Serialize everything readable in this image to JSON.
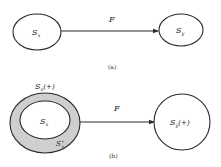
{
  "panel_a": {
    "source_node": {
      "label": "S",
      "subscript": "x"
    },
    "target_node": {
      "label": "S",
      "subscript": "y"
    },
    "edge_label": "F",
    "caption": "(a)"
  },
  "panel_b": {
    "outer_region": {
      "label": "S",
      "subscript": "x",
      "suffix": "(+)"
    },
    "inner_node": {
      "label": "S",
      "subscript": "x"
    },
    "ring_region": {
      "label": "S",
      "subscript": "x",
      "superscript": "+"
    },
    "target_node": {
      "label": "S",
      "subscript": "y",
      "suffix": "(+)"
    },
    "edge_label": "F",
    "caption": "(b)"
  },
  "colors": {
    "stroke": "#2a2a2a",
    "ring_fill": "#cfcfcf",
    "background": "#ffffff"
  }
}
